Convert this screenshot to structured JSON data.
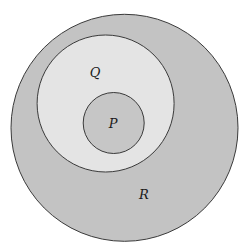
{
  "diagram": {
    "type": "nested-venn",
    "colors": {
      "background": "#ffffff",
      "stroke": "#3a3a3a",
      "r_fill": "#c3c3c3",
      "q_fill": "#e4e4e4",
      "p_fill": "#c6c6c6"
    },
    "sets": [
      {
        "id": "R",
        "label": "R",
        "cx": 124.5,
        "cy": 127.8,
        "r": 113.5,
        "label_x": 144,
        "label_y": 199
      },
      {
        "id": "Q",
        "label": "Q",
        "cx": 105.6,
        "cy": 103.5,
        "r": 68.5,
        "label_x": 95,
        "label_y": 77
      },
      {
        "id": "P",
        "label": "P",
        "cx": 113.7,
        "cy": 123,
        "r": 30.5,
        "label_x": 113,
        "label_y": 128
      }
    ]
  }
}
